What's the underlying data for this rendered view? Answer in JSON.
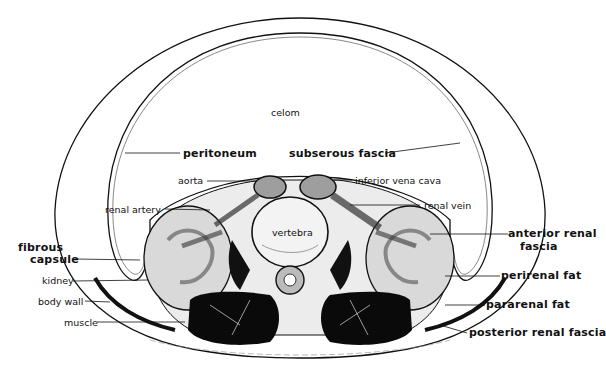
{
  "figure": {
    "type": "anatomical cross-section",
    "labels": {
      "celom": "celom",
      "peritoneum": "peritoneum",
      "subserous_fascia": "subserous fascia",
      "aorta": "aorta",
      "inferior_vena_cava": "inferior vena cava",
      "renal_artery": "renal artery",
      "renal_vein": "renal vein",
      "vertebra": "vertebra",
      "fibrous_capsule_line1": "fibrous",
      "fibrous_capsule_line2": "capsule",
      "kidney": "kidney",
      "body_wall": "body wall",
      "muscle": "muscle",
      "anterior_renal_fascia_line1": "anterior renal",
      "anterior_renal_fascia_line2": "fascia",
      "perirenal_fat": "perirenal fat",
      "pararenal_fat": "pararenal fat",
      "posterior_renal_fascia": "posterior renal fascia"
    },
    "colors": {
      "ink": "#111111",
      "background": "#ffffff",
      "muscle_fill": "#0a0a0a",
      "tissue_gray": "#bdbdbd"
    }
  }
}
